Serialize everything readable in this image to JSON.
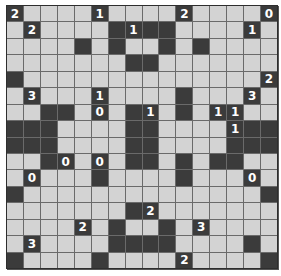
{
  "puzzle": {
    "name": "Light Up",
    "rows": 16,
    "cols": 16,
    "legend": {
      "W": "empty white cell",
      "B": "black wall",
      "0-4": "numbered black wall"
    },
    "grid": [
      [
        "2",
        "W",
        "W",
        "W",
        "W",
        "1",
        "W",
        "W",
        "W",
        "W",
        "2",
        "W",
        "W",
        "W",
        "W",
        "0"
      ],
      [
        "W",
        "2",
        "W",
        "W",
        "W",
        "W",
        "B",
        "1",
        "B",
        "B",
        "W",
        "W",
        "W",
        "W",
        "1",
        "W"
      ],
      [
        "W",
        "W",
        "W",
        "W",
        "B",
        "W",
        "B",
        "W",
        "W",
        "B",
        "W",
        "B",
        "W",
        "W",
        "W",
        "W"
      ],
      [
        "W",
        "W",
        "W",
        "W",
        "W",
        "W",
        "W",
        "B",
        "B",
        "W",
        "W",
        "W",
        "W",
        "W",
        "W",
        "W"
      ],
      [
        "B",
        "W",
        "W",
        "W",
        "W",
        "W",
        "W",
        "W",
        "W",
        "W",
        "W",
        "W",
        "W",
        "W",
        "W",
        "2"
      ],
      [
        "W",
        "3",
        "W",
        "W",
        "W",
        "1",
        "W",
        "W",
        "W",
        "W",
        "B",
        "W",
        "W",
        "W",
        "3",
        "W"
      ],
      [
        "W",
        "W",
        "B",
        "B",
        "W",
        "0",
        "W",
        "B",
        "1",
        "W",
        "B",
        "W",
        "1",
        "1",
        "W",
        "W"
      ],
      [
        "B",
        "B",
        "B",
        "W",
        "W",
        "W",
        "W",
        "B",
        "B",
        "W",
        "W",
        "W",
        "W",
        "1",
        "B",
        "B"
      ],
      [
        "B",
        "B",
        "B",
        "W",
        "W",
        "W",
        "W",
        "B",
        "B",
        "W",
        "W",
        "W",
        "W",
        "B",
        "B",
        "B"
      ],
      [
        "W",
        "W",
        "B",
        "0",
        "W",
        "0",
        "W",
        "B",
        "B",
        "W",
        "B",
        "W",
        "B",
        "B",
        "W",
        "W"
      ],
      [
        "W",
        "0",
        "W",
        "W",
        "W",
        "B",
        "W",
        "W",
        "W",
        "W",
        "B",
        "W",
        "W",
        "W",
        "0",
        "W"
      ],
      [
        "B",
        "W",
        "W",
        "W",
        "W",
        "W",
        "W",
        "W",
        "W",
        "W",
        "W",
        "W",
        "W",
        "W",
        "W",
        "B"
      ],
      [
        "W",
        "W",
        "W",
        "W",
        "W",
        "W",
        "W",
        "B",
        "2",
        "W",
        "W",
        "W",
        "W",
        "W",
        "W",
        "W"
      ],
      [
        "W",
        "W",
        "W",
        "W",
        "2",
        "W",
        "B",
        "W",
        "W",
        "B",
        "W",
        "3",
        "W",
        "W",
        "W",
        "W"
      ],
      [
        "W",
        "3",
        "W",
        "W",
        "W",
        "W",
        "B",
        "B",
        "B",
        "B",
        "W",
        "W",
        "W",
        "W",
        "B",
        "W"
      ],
      [
        "B",
        "W",
        "W",
        "W",
        "W",
        "B",
        "W",
        "W",
        "W",
        "W",
        "2",
        "W",
        "W",
        "W",
        "W",
        "B"
      ]
    ]
  },
  "colors": {
    "white_cell": "#d3d3d3",
    "black_cell": "#3b3b3b",
    "grid_line": "#6a6a6a",
    "number_text": "#ffffff"
  }
}
